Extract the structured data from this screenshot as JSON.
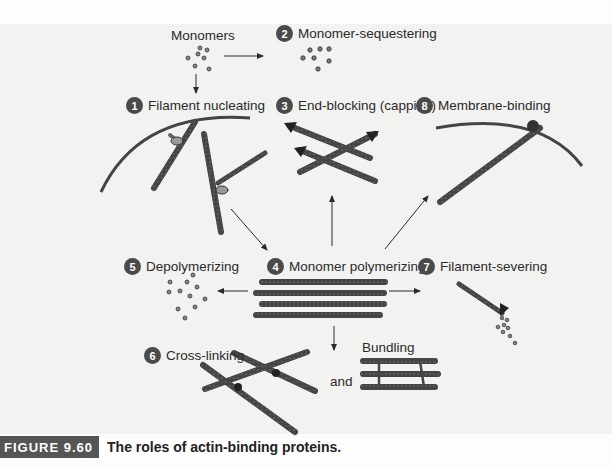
{
  "figure": {
    "number": "FIGURE 9.60",
    "title": "The roles of actin-binding proteins."
  },
  "labels": {
    "monomers": "Monomers",
    "and": "and",
    "bundling": "Bundling"
  },
  "steps": [
    {
      "num": "1",
      "label": "Filament nucleating"
    },
    {
      "num": "2",
      "label": "Monomer-sequestering"
    },
    {
      "num": "3",
      "label": "End-blocking (capping)"
    },
    {
      "num": "4",
      "label": "Monomer polymerizing"
    },
    {
      "num": "5",
      "label": "Depolymerizing"
    },
    {
      "num": "6",
      "label": "Cross-linking"
    },
    {
      "num": "7",
      "label": "Filament-severing"
    },
    {
      "num": "8",
      "label": "Membrane-binding"
    }
  ],
  "colors": {
    "badge": "#4a4a4a",
    "filament": "#555555",
    "panel": "#f2f2f1",
    "caption_tag": "#555555"
  }
}
